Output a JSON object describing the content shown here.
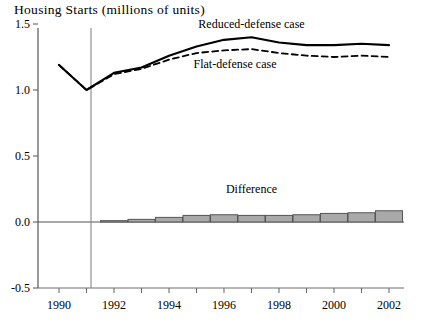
{
  "chart_data": {
    "type": "line",
    "title": "Housing Starts (millions of units)",
    "xlabel": "",
    "ylabel": "",
    "xlim": [
      1989.5,
      2002.6
    ],
    "ylim": [
      -0.5,
      1.5
    ],
    "yticks": [
      "1.5",
      "1.0",
      "0.5",
      "0.0",
      "-0.5"
    ],
    "ytick_values": [
      1.5,
      1.0,
      0.5,
      0.0,
      -0.5
    ],
    "xticks": [
      "1990",
      "1992",
      "1994",
      "1996",
      "1998",
      "2000",
      "2002"
    ],
    "xtick_values": [
      1990,
      1992,
      1994,
      1996,
      1998,
      2000,
      2002
    ],
    "minor_xticks": [
      1991,
      1993,
      1995,
      1997,
      1999,
      2001
    ],
    "grid": false,
    "legend_position": "inline-annotations",
    "x": [
      1990,
      1991,
      1992,
      1993,
      1994,
      1995,
      1996,
      1997,
      1998,
      1999,
      2000,
      2001,
      2002
    ],
    "series": [
      {
        "name": "Reduced-defense case",
        "style": "solid",
        "color": "#000000",
        "values": [
          1.19,
          1.0,
          1.13,
          1.17,
          1.26,
          1.33,
          1.38,
          1.4,
          1.36,
          1.34,
          1.34,
          1.35,
          1.34
        ]
      },
      {
        "name": "Flat-defense case",
        "style": "dashed",
        "color": "#000000",
        "values": [
          1.19,
          1.0,
          1.12,
          1.16,
          1.23,
          1.28,
          1.3,
          1.31,
          1.28,
          1.26,
          1.25,
          1.26,
          1.25
        ]
      },
      {
        "name": "Difference",
        "style": "bar",
        "color": "#a9a9a9",
        "edge_color": "#555555",
        "values": [
          0.0,
          0.0,
          0.01,
          0.02,
          0.035,
          0.05,
          0.055,
          0.05,
          0.05,
          0.055,
          0.065,
          0.07,
          0.085
        ]
      }
    ],
    "annotations": [
      {
        "text": "Reduced-defense case",
        "x": 1997.0,
        "y": 1.47,
        "name": "reduced-defense-label"
      },
      {
        "text": "Flat-defense case",
        "x": 1996.4,
        "y": 1.17,
        "name": "flat-defense-label"
      },
      {
        "text": "Difference",
        "x": 1997.0,
        "y": 0.22,
        "name": "difference-label"
      }
    ],
    "vertical_divider": {
      "x": 1991.6,
      "label": ""
    },
    "zero_line": 0.0
  },
  "caption": {
    "text": ""
  }
}
